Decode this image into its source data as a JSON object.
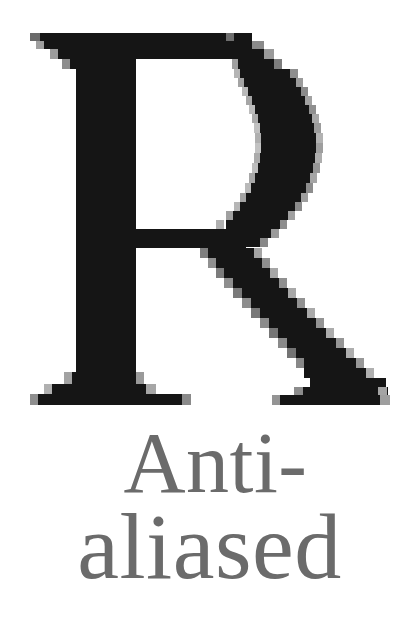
{
  "canvas": {
    "width": 417,
    "height": 642,
    "background_color": "#ffffff"
  },
  "specimen": {
    "glyph": {
      "character": "R",
      "rendering_mode": "aliased",
      "color": "#151515",
      "edge_color_light": "#8a8a8a",
      "edge_color_mid": "#4a4a4a",
      "bounds": {
        "x": 30,
        "y": 33,
        "width": 360,
        "height": 372
      },
      "description": "Large serif capital R rendered without anti-aliasing, showing stair-step jagged edges on curves and diagonals"
    },
    "caption": {
      "full_text": "Anti-aliased",
      "color": "#6b6b6b",
      "rendering_mode": "anti-aliased",
      "lines": [
        {
          "text": "Anti-"
        },
        {
          "text": "aliased"
        }
      ]
    }
  }
}
